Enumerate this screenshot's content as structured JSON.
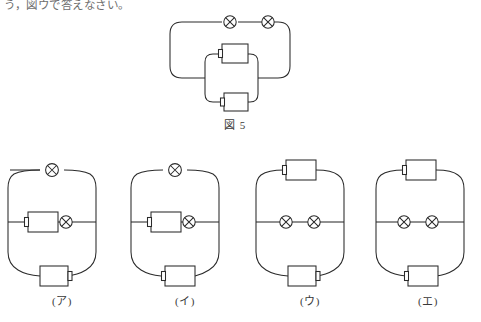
{
  "page": {
    "top_sentence": "う，図ウで答えなさい。",
    "background_color": "#ffffff",
    "ink_color": "#2b2b2b"
  },
  "figure5": {
    "caption": "図 5",
    "description": "two lamps in series on top branch; two resistors in parallel on inner lower branch",
    "components": {
      "top_branch": [
        {
          "type": "lamp",
          "symbol": "circle-x"
        },
        {
          "type": "lamp",
          "symbol": "circle-x"
        }
      ],
      "inner_parallel": [
        {
          "type": "resistor",
          "symbol": "box-with-tab",
          "tab_side": "left"
        },
        {
          "type": "resistor",
          "symbol": "box-with-tab",
          "tab_side": "left"
        }
      ]
    }
  },
  "options": [
    {
      "label": "(ア)",
      "top": [
        {
          "type": "lamp",
          "symbol": "circle-x"
        }
      ],
      "middle": [
        {
          "type": "resistor",
          "symbol": "box-with-tab",
          "tab_side": "left"
        },
        {
          "type": "lamp",
          "symbol": "circle-x"
        }
      ],
      "bottom": [
        {
          "type": "resistor",
          "symbol": "box-with-tab",
          "tab_side": "right"
        }
      ]
    },
    {
      "label": "(イ)",
      "top": [
        {
          "type": "lamp",
          "symbol": "circle-x"
        }
      ],
      "middle": [
        {
          "type": "resistor",
          "symbol": "box-with-tab",
          "tab_side": "left"
        },
        {
          "type": "lamp",
          "symbol": "circle-x"
        }
      ],
      "bottom": [
        {
          "type": "resistor",
          "symbol": "box-with-tab",
          "tab_side": "left"
        }
      ]
    },
    {
      "label": "(ウ)",
      "top": [
        {
          "type": "resistor",
          "symbol": "box-with-tab",
          "tab_side": "left"
        }
      ],
      "middle": [
        {
          "type": "lamp",
          "symbol": "circle-x"
        },
        {
          "type": "lamp",
          "symbol": "circle-x"
        }
      ],
      "bottom": [
        {
          "type": "resistor",
          "symbol": "box-with-tab",
          "tab_side": "right"
        }
      ]
    },
    {
      "label": "(エ)",
      "top": [
        {
          "type": "resistor",
          "symbol": "box-with-tab",
          "tab_side": "right"
        }
      ],
      "middle": [
        {
          "type": "lamp",
          "symbol": "circle-x"
        },
        {
          "type": "lamp",
          "symbol": "circle-x"
        }
      ],
      "bottom": [
        {
          "type": "resistor",
          "symbol": "box-with-tab",
          "tab_side": "left"
        }
      ]
    }
  ]
}
